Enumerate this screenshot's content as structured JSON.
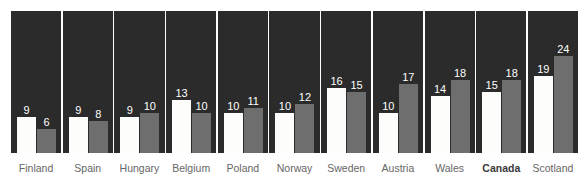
{
  "chart_data": {
    "type": "bar",
    "title": "",
    "xlabel": "",
    "ylabel": "",
    "ylim": [
      0,
      25
    ],
    "grid": false,
    "legend_position": "none",
    "categories": [
      "Finland",
      "Spain",
      "Hungary",
      "Belgium",
      "Poland",
      "Norway",
      "Sweden",
      "Austria",
      "Wales",
      "Canada",
      "Scotland"
    ],
    "highlight_category": "Canada",
    "series": [
      {
        "name": "series-1",
        "color": "#fdfdfb",
        "values": [
          9,
          9,
          9,
          13,
          10,
          10,
          16,
          10,
          14,
          15,
          19
        ]
      },
      {
        "name": "series-2",
        "color": "#6e6e6e",
        "values": [
          6,
          8,
          10,
          10,
          11,
          12,
          15,
          17,
          18,
          18,
          24
        ]
      }
    ],
    "panel_background": "#2b2b2b",
    "panel_divider_color": "#ffffff",
    "value_label_color": "#ffffff",
    "category_label_color": "#666666"
  }
}
